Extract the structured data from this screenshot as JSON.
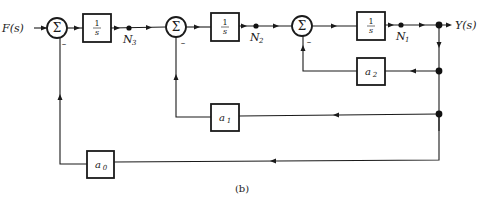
{
  "diagram": {
    "input_label": "F(s)",
    "output_label": "Y(s)",
    "caption": "(b)",
    "summing_junctions": [
      {
        "symbol": "Σ",
        "minus_sign": "–"
      },
      {
        "symbol": "Σ",
        "minus_sign": "–"
      },
      {
        "symbol": "Σ",
        "minus_sign": "–"
      }
    ],
    "integrators": [
      {
        "numerator": "1",
        "denominator": "s"
      },
      {
        "numerator": "1",
        "denominator": "s"
      },
      {
        "numerator": "1",
        "denominator": "s"
      }
    ],
    "nodes": [
      {
        "label": "N",
        "subscript": "3"
      },
      {
        "label": "N",
        "subscript": "2"
      },
      {
        "label": "N",
        "subscript": "1"
      }
    ],
    "feedback_gains": [
      {
        "label": "a",
        "subscript": "2"
      },
      {
        "label": "a",
        "subscript": "1"
      },
      {
        "label": "a",
        "subscript": "0"
      }
    ]
  }
}
